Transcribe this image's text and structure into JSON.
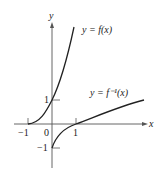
{
  "diagram": {
    "type": "function-and-inverse-graph",
    "axes": {
      "x_label": "x",
      "y_label": "y",
      "x_ticks": [
        {
          "value": -1,
          "label": "−1"
        },
        {
          "value": 0,
          "label": "0"
        },
        {
          "value": 1,
          "label": "1"
        }
      ],
      "y_ticks": [
        {
          "value": 1,
          "label": "1"
        },
        {
          "value": -1,
          "label": "−1"
        }
      ]
    },
    "curves": [
      {
        "name": "f",
        "label": "y = f(x)",
        "through": [
          [
            -1,
            0
          ],
          [
            0,
            1
          ]
        ]
      },
      {
        "name": "f-inverse",
        "label": "y = f⁻¹(x)",
        "through": [
          [
            0,
            -1
          ],
          [
            1,
            0
          ]
        ]
      }
    ],
    "colors": {
      "line": "#222222",
      "axis": "#555555",
      "background": "#ffffff"
    }
  }
}
